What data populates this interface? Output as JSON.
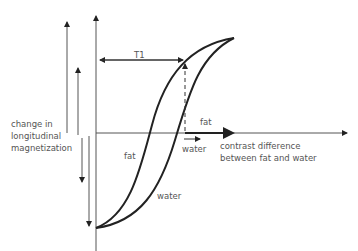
{
  "diagram": {
    "labels": {
      "t1": "T1",
      "y_axis_line1": "change in",
      "y_axis_line2": "longitudinal",
      "y_axis_line3": "magnetization",
      "x_axis_line1": "contrast difference",
      "x_axis_line2": "between fat and water",
      "fat_arrow": "fat",
      "water_arrow": "water",
      "fat_curve": "fat",
      "water_curve": "water"
    },
    "curves": [
      {
        "name": "fat",
        "description": "faster T1 recovery curve (left)"
      },
      {
        "name": "water",
        "description": "slower T1 recovery curve (right)"
      }
    ],
    "colors": {
      "line": "#222222",
      "text": "#555555"
    }
  }
}
